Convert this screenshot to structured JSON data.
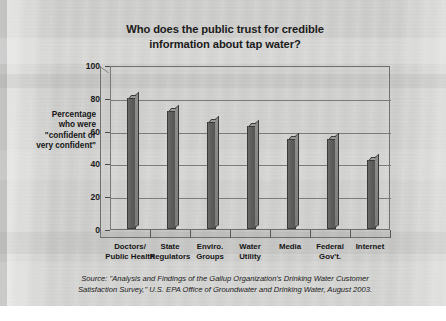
{
  "slide": {
    "title_line1": "Who does the public trust for credible",
    "title_line2": "information about tap water?",
    "source_line1": "Source: \"Analysis and Findings of the Gallup Organization's Drinking Water Customer",
    "source_line2": "Satisfaction Survey,\" U.S. EPA Office of Groundwater and Drinking Water, August 2003.",
    "background_color": "#cdcdcb",
    "bar_color": "#5c5c5a",
    "text_color": "#1b1b1b"
  },
  "axis_title": {
    "line1": "Percentage",
    "line2": "who were",
    "line3": "\"confident or",
    "line4": "very confident\""
  },
  "chart_data": {
    "type": "bar",
    "title": "Who does the public trust for credible information about tap water?",
    "xlabel": "",
    "ylabel": "Percentage who were \"confident or very confident\"",
    "ylim": [
      0,
      100
    ],
    "yticks": [
      0,
      20,
      40,
      60,
      80,
      100
    ],
    "grid": true,
    "legend": false,
    "categories": [
      "Doctors/ Public Health",
      "State Regulators",
      "Enviro. Groups",
      "Water Utility",
      "Media",
      "Federal Gov't.",
      "Internet"
    ],
    "category_lines": [
      [
        "Doctors/",
        "Public Health"
      ],
      [
        "State",
        "Regulators"
      ],
      [
        "Enviro.",
        "Groups"
      ],
      [
        "Water",
        "Utility"
      ],
      [
        "Media",
        ""
      ],
      [
        "Federal",
        "Gov't."
      ],
      [
        "Internet",
        ""
      ]
    ],
    "values": [
      80,
      72,
      65,
      63,
      55,
      55,
      42
    ],
    "annotation": "Source: \"Analysis and Findings of the Gallup Organization's Drinking Water Customer Satisfaction Survey,\" U.S. EPA Office of Groundwater and Drinking Water, August 2003."
  }
}
